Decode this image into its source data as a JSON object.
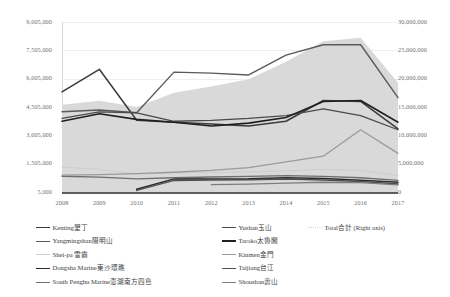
{
  "chart_data": {
    "type": "line",
    "title": "",
    "xlabel": "",
    "ylabel": "",
    "categories": [
      2008,
      2009,
      2010,
      2011,
      2012,
      2013,
      2014,
      2015,
      2016,
      2017
    ],
    "y_left_ticks": [
      "9,005,000",
      "7,505,000",
      "6,005,000",
      "4,505,000",
      "3,005,000",
      "1,505,000",
      "5,000"
    ],
    "y_right_ticks": [
      "30,000,000",
      "25,000,000",
      "20,000,000",
      "15,000,000",
      "10,000,000",
      "5,000,000",
      "0"
    ],
    "ylim": [
      5000,
      9005000
    ],
    "ylim_right": [
      0,
      30000000
    ],
    "grid": true,
    "legend_position": "bottom",
    "series": [
      {
        "name": "Kenting墾丁",
        "label_en": "Kenting",
        "label_zh": "墾丁",
        "axis": "left",
        "color": "#3b3b3b",
        "width": 1.5,
        "values": [
          5300000,
          6500000,
          3800000,
          3700000,
          3600000,
          3500000,
          3750000,
          4850000,
          4800000,
          3350000
        ]
      },
      {
        "name": "Yangmingshan陽明山",
        "label_en": "Yangmingshan",
        "label_zh": "陽明山",
        "axis": "left",
        "color": "#5a5a5a",
        "width": 1.4,
        "values": [
          4250000,
          4350000,
          4200000,
          6350000,
          6300000,
          6200000,
          7250000,
          7800000,
          7800000,
          5000000
        ]
      },
      {
        "name": "Shei-pa 雪霸",
        "label_en": "Shei-pa",
        "label_zh": "雪霸",
        "axis": "left",
        "color": "#cfcfcf",
        "width": 1.2,
        "values": [
          1320000,
          1200000,
          960000,
          1000000,
          1030000,
          1070000,
          1120000,
          1200000,
          1150000,
          870000
        ]
      },
      {
        "name": "Dongsha Marine東沙環礁",
        "label_en": "Dongsha Marine",
        "label_zh": "東沙環礁",
        "axis": "left",
        "color": "#2b2b2b",
        "width": 1.5,
        "values": [
          null,
          null,
          150000,
          700000,
          690000,
          700000,
          760000,
          720000,
          630000,
          520000
        ]
      },
      {
        "name": "South Penghu Marine澎湖南方四島",
        "label_en": "South Penghu Marine",
        "label_zh": "澎湖南方四島",
        "axis": "left",
        "color": "#6e6e6e",
        "width": 1.3,
        "values": [
          840000,
          790000,
          700000,
          760000,
          800000,
          830000,
          870000,
          830000,
          760000,
          620000
        ]
      },
      {
        "name": "Yushan玉山",
        "label_en": "Yushan",
        "label_zh": "玉山",
        "axis": "left",
        "color": "#4a4a4a",
        "width": 1.3,
        "values": [
          3900000,
          4250000,
          4200000,
          3750000,
          3800000,
          3900000,
          4050000,
          4400000,
          4050000,
          3300000
        ]
      },
      {
        "name": "Taroko太魯閣",
        "label_en": "Taroko",
        "label_zh": "太魯閣",
        "axis": "left",
        "color": "#202020",
        "width": 1.6,
        "values": [
          3750000,
          4150000,
          3850000,
          3700000,
          3500000,
          3650000,
          3950000,
          4800000,
          4850000,
          3700000
        ]
      },
      {
        "name": "Kinmen金門",
        "label_en": "Kinmen",
        "label_zh": "金門",
        "axis": "left",
        "color": "#9a9a9a",
        "width": 1.3,
        "values": [
          900000,
          930000,
          980000,
          1050000,
          1150000,
          1300000,
          1600000,
          1900000,
          3300000,
          2050000
        ]
      },
      {
        "name": "Taijiang台江",
        "label_en": "Taijiang",
        "label_zh": "台江",
        "axis": "left",
        "color": "#4f4f4f",
        "width": 1.5,
        "values": [
          null,
          null,
          90000,
          620000,
          640000,
          650000,
          690000,
          640000,
          560000,
          430000
        ]
      },
      {
        "name": "Shoushan壽山",
        "label_en": "Shoushan",
        "label_zh": "壽山",
        "axis": "left",
        "color": "#7d7d7d",
        "width": 1.3,
        "values": [
          null,
          null,
          null,
          null,
          400000,
          420000,
          480000,
          520000,
          500000,
          380000
        ]
      },
      {
        "name": "Total合計 (Right axis)",
        "label_en": "Total",
        "label_zh": "合計",
        "label_suffix": "(Right axis)",
        "axis": "right",
        "type": "area",
        "color": "#d9d9d9",
        "width": 0,
        "values": [
          15400000,
          16100000,
          15000000,
          17500000,
          18600000,
          19900000,
          23000000,
          26600000,
          27200000,
          19300000
        ]
      }
    ],
    "legend_columns": [
      [
        "Kenting墾丁",
        "Yangmingshan陽明山",
        "Shei-pa 雪霸",
        "Dongsha Marine東沙環礁",
        "South Penghu Marine澎湖南方四島"
      ],
      [
        "Yushan玉山",
        "Taroko太魯閣",
        "Kinmen金門",
        "Taijiang台江",
        "Shoushan壽山"
      ],
      [
        "Total合計 (Right axis)"
      ]
    ]
  }
}
